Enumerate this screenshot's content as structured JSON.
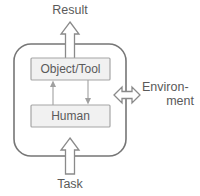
{
  "diagram": {
    "colors": {
      "box_fill": "#f1f1f1",
      "box_stroke": "#a6a6a6",
      "container_stroke": "#767676",
      "arrow_fill": "#ffffff",
      "arrow_stroke": "#8a8a8a",
      "thin_arrow": "#a0a0a0",
      "text": "#5a5a5a",
      "background": "#ffffff"
    },
    "nodes": [
      {
        "id": "object-tool",
        "label": "Object/Tool"
      },
      {
        "id": "human",
        "label": "Human"
      }
    ],
    "container": {
      "id": "system-boundary",
      "label": ""
    },
    "flows": [
      {
        "id": "result",
        "label": "Result",
        "direction": "up",
        "position": "top"
      },
      {
        "id": "task",
        "label": "Task",
        "direction": "up",
        "position": "bottom"
      },
      {
        "id": "environment",
        "label_line1": "Environ-",
        "label_line2": "ment",
        "direction": "bidirectional",
        "position": "right"
      }
    ],
    "internal_flows": [
      {
        "id": "human-to-object",
        "direction": "up",
        "from": "human",
        "to": "object-tool"
      },
      {
        "id": "object-to-human",
        "direction": "down",
        "from": "object-tool",
        "to": "human"
      }
    ]
  }
}
